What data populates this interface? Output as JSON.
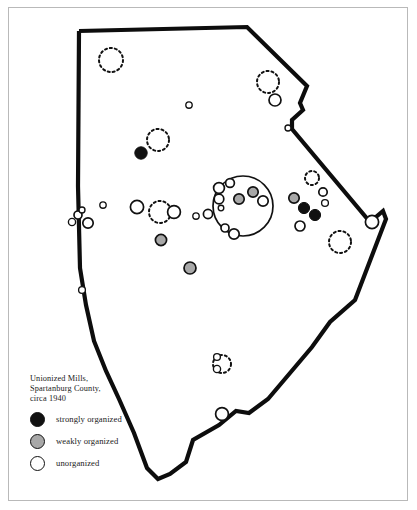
{
  "figure": {
    "kind": "thematic-point-map",
    "background_color": "#ffffff",
    "frame_color": "#b9b9b9"
  },
  "legend": {
    "title": "Unionized Mills,\nSpartanburg County,\ncirca 1940",
    "title_lines": [
      "Unionized Mills,",
      "Spartanburg County,",
      "circa 1940"
    ],
    "entries": [
      {
        "key": "strongly",
        "label": "strongly organized",
        "fill": "#111111",
        "stroke": "#111111"
      },
      {
        "key": "weakly",
        "label": "weakly organized",
        "fill": "#a8a8a8",
        "stroke": "#111111"
      },
      {
        "key": "unorganized",
        "label": "unorganized",
        "fill": "#ffffff",
        "stroke": "#111111"
      }
    ]
  },
  "map_data": {
    "type": "point-map",
    "title": "Unionized Mills, Spartanburg County, circa 1940",
    "boundary_color": "#0d0d0d",
    "boundary_width": 4.2,
    "county_outline": [
      [
        79,
        31
      ],
      [
        247,
        27
      ],
      [
        307,
        86
      ],
      [
        300,
        103
      ],
      [
        303,
        110
      ],
      [
        292,
        120
      ],
      [
        292,
        129
      ],
      [
        370,
        222
      ],
      [
        383,
        211
      ],
      [
        386,
        219
      ],
      [
        355,
        300
      ],
      [
        330,
        322
      ],
      [
        312,
        347
      ],
      [
        268,
        399
      ],
      [
        249,
        413
      ],
      [
        236,
        411
      ],
      [
        219,
        425
      ],
      [
        193,
        440
      ],
      [
        186,
        462
      ],
      [
        170,
        474
      ],
      [
        158,
        479
      ],
      [
        147,
        468
      ],
      [
        134,
        433
      ],
      [
        119,
        399
      ],
      [
        106,
        371
      ],
      [
        94,
        341
      ],
      [
        86,
        305
      ],
      [
        80,
        268
      ],
      [
        78,
        186
      ],
      [
        79,
        31
      ]
    ],
    "city_circles": [
      {
        "name": "spartanburg",
        "cx": 243,
        "cy": 206,
        "r": 30,
        "style": "solid"
      },
      {
        "name": "town-nw",
        "cx": 111,
        "cy": 60,
        "r": 12,
        "style": "dotted"
      },
      {
        "name": "town-north-mid",
        "cx": 158,
        "cy": 140,
        "r": 11,
        "style": "dotted"
      },
      {
        "name": "town-ne",
        "cx": 268,
        "cy": 82,
        "r": 11,
        "style": "dotted"
      },
      {
        "name": "town-west-mid",
        "cx": 160,
        "cy": 212,
        "r": 11,
        "style": "dotted"
      },
      {
        "name": "town-east",
        "cx": 340,
        "cy": 242,
        "r": 11,
        "style": "dotted"
      },
      {
        "name": "town-east-upper",
        "cx": 312,
        "cy": 178,
        "r": 7,
        "style": "dotted"
      },
      {
        "name": "town-south",
        "cx": 222,
        "cy": 364,
        "r": 9,
        "style": "dotted"
      }
    ],
    "mills": [
      {
        "x": 141,
        "y": 153,
        "r": 6.2,
        "status": "strongly"
      },
      {
        "x": 304,
        "y": 208,
        "r": 5.6,
        "status": "strongly"
      },
      {
        "x": 315,
        "y": 215,
        "r": 5.6,
        "status": "strongly"
      },
      {
        "x": 161,
        "y": 240,
        "r": 5.6,
        "status": "weakly"
      },
      {
        "x": 190,
        "y": 268,
        "r": 6.0,
        "status": "weakly"
      },
      {
        "x": 239,
        "y": 199,
        "r": 5.2,
        "status": "weakly"
      },
      {
        "x": 253,
        "y": 192,
        "r": 5.2,
        "status": "weakly"
      },
      {
        "x": 294,
        "y": 198,
        "r": 5.2,
        "status": "weakly"
      },
      {
        "x": 189,
        "y": 105,
        "r": 3.2,
        "status": "unorganized"
      },
      {
        "x": 275,
        "y": 100,
        "r": 6.0,
        "status": "unorganized"
      },
      {
        "x": 288,
        "y": 128,
        "r": 3.0,
        "status": "unorganized"
      },
      {
        "x": 137,
        "y": 207,
        "r": 6.6,
        "status": "unorganized"
      },
      {
        "x": 174,
        "y": 212,
        "r": 6.4,
        "status": "unorganized"
      },
      {
        "x": 196,
        "y": 216,
        "r": 3.2,
        "status": "unorganized"
      },
      {
        "x": 208,
        "y": 214,
        "r": 4.6,
        "status": "unorganized"
      },
      {
        "x": 219,
        "y": 199,
        "r": 4.8,
        "status": "unorganized"
      },
      {
        "x": 221,
        "y": 208,
        "r": 2.8,
        "status": "unorganized"
      },
      {
        "x": 219,
        "y": 188,
        "r": 5.4,
        "status": "unorganized"
      },
      {
        "x": 230,
        "y": 183,
        "r": 4.4,
        "status": "unorganized"
      },
      {
        "x": 263,
        "y": 201,
        "r": 5.2,
        "status": "unorganized"
      },
      {
        "x": 225,
        "y": 228,
        "r": 4.0,
        "status": "unorganized"
      },
      {
        "x": 234,
        "y": 234,
        "r": 5.2,
        "status": "unorganized"
      },
      {
        "x": 300,
        "y": 226,
        "r": 5.0,
        "status": "unorganized"
      },
      {
        "x": 323,
        "y": 192,
        "r": 4.2,
        "status": "unorganized"
      },
      {
        "x": 325,
        "y": 203,
        "r": 3.4,
        "status": "unorganized"
      },
      {
        "x": 372,
        "y": 222,
        "r": 6.6,
        "status": "unorganized"
      },
      {
        "x": 222,
        "y": 414,
        "r": 6.4,
        "status": "unorganized"
      },
      {
        "x": 103,
        "y": 205,
        "r": 3.2,
        "status": "unorganized"
      },
      {
        "x": 78,
        "y": 215,
        "r": 4.0,
        "status": "unorganized"
      },
      {
        "x": 72,
        "y": 222,
        "r": 3.6,
        "status": "unorganized"
      },
      {
        "x": 88,
        "y": 223,
        "r": 5.2,
        "status": "unorganized"
      },
      {
        "x": 82,
        "y": 210,
        "r": 3.0,
        "status": "unorganized"
      },
      {
        "x": 82,
        "y": 290,
        "r": 3.4,
        "status": "unorganized"
      },
      {
        "x": 217,
        "y": 357,
        "r": 3.4,
        "status": "unorganized"
      },
      {
        "x": 217,
        "y": 369,
        "r": 3.6,
        "status": "unorganized"
      }
    ],
    "counts": {
      "strongly": 3,
      "weakly": 5,
      "unorganized": 27
    }
  }
}
